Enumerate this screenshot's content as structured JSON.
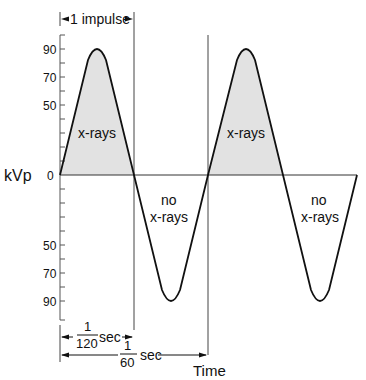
{
  "diagram": {
    "y_axis_label": "kVp",
    "x_axis_label": "Time",
    "y_ticks_upper": [
      "90",
      "70",
      "50"
    ],
    "y_zero": "0",
    "y_ticks_lower": [
      "50",
      "70",
      "90"
    ],
    "impulse_label": "1 impulse",
    "regions": [
      {
        "label": "x-rays",
        "type": "positive"
      },
      {
        "label_line1": "no",
        "label_line2": "x-rays",
        "type": "negative"
      },
      {
        "label": "x-rays",
        "type": "positive"
      },
      {
        "label_line1": "no",
        "label_line2": "x-rays",
        "type": "negative"
      }
    ],
    "half_period": {
      "numerator": "1",
      "denominator": "120",
      "unit": "sec"
    },
    "full_period": {
      "numerator": "1",
      "denominator": "60",
      "unit": "sec"
    },
    "colors": {
      "line": "#111111",
      "fill_xrays": "#e2e2e2",
      "axis": "#555555"
    }
  }
}
